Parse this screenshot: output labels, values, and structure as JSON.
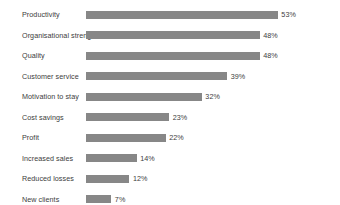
{
  "chart_data": {
    "type": "bar",
    "orientation": "horizontal",
    "title": "",
    "subtitle": "",
    "xlabel": "",
    "ylabel": "",
    "grid": false,
    "legend": "none",
    "xlim": [
      0,
      53
    ],
    "value_suffix": "%",
    "bar_color": "#878787",
    "text_color": "#3c3c3c",
    "background_color": "#ffffff",
    "categories": [
      "Productivity",
      "Organisational strength",
      "Quality",
      "Customer service",
      "Motivation to stay",
      "Cost savings",
      "Profit",
      "Increased sales",
      "Reduced losses",
      "New clients"
    ],
    "values": [
      53,
      48,
      48,
      39,
      32,
      23,
      22,
      14,
      12,
      7
    ],
    "value_labels": [
      "53%",
      "48%",
      "48%",
      "39%",
      "32%",
      "23%",
      "22%",
      "14%",
      "12%",
      "7%"
    ]
  }
}
